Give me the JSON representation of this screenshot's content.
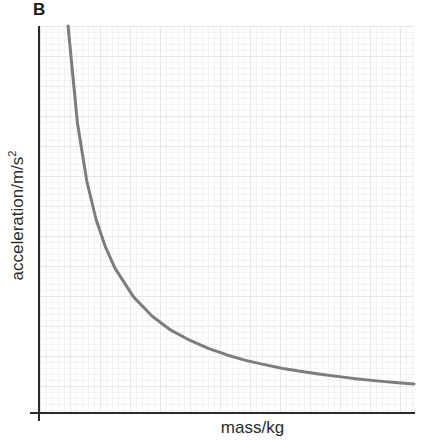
{
  "figure": {
    "panel_label": "B",
    "background_color": "#ffffff"
  },
  "axes": {
    "x_title": "mass/kg",
    "y_title_main": "acceleration/m/s",
    "y_title_exponent": "2",
    "axis_color": "#2a2a2a",
    "grid_major_color": "#e3e7ee",
    "grid_minor_color": "#f1f3f7"
  },
  "chart_data": {
    "type": "line",
    "title": "B",
    "xlabel": "mass/kg",
    "ylabel": "acceleration/m/s^2",
    "grid": true,
    "legend": "none",
    "curve_color": "#7d7d7d",
    "curve_width_px": 3,
    "relationship": "inverse proportion (a = F/m)",
    "xlim": [
      0,
      10
    ],
    "ylim": [
      0,
      10
    ],
    "x": [
      0.75,
      1.0,
      1.25,
      1.5,
      1.75,
      2.0,
      2.5,
      3.0,
      3.5,
      4.0,
      4.5,
      5.0,
      5.5,
      6.0,
      6.5,
      7.0,
      7.5,
      8.0,
      8.5,
      9.0,
      9.5,
      10.0
    ],
    "y": [
      10.0,
      7.5,
      6.0,
      5.0,
      4.29,
      3.75,
      3.0,
      2.5,
      2.14,
      1.88,
      1.67,
      1.5,
      1.36,
      1.25,
      1.15,
      1.07,
      1.0,
      0.94,
      0.88,
      0.83,
      0.79,
      0.75
    ],
    "annotations": []
  }
}
